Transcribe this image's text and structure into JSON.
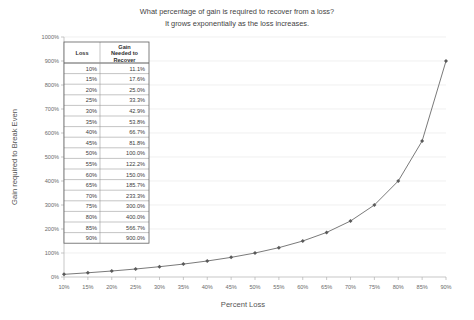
{
  "chart_data": {
    "type": "line",
    "title": "What percentage of gain is required to recover from a loss?",
    "subtitle": "It grows exponentially as the loss increases.",
    "xlabel": "Percent Loss",
    "ylabel": "Gain required to Break Even",
    "xlim": [
      10,
      90
    ],
    "ylim": [
      0,
      1000
    ],
    "grid": true,
    "legend": "none",
    "x_tick_labels": [
      "10%",
      "15%",
      "20%",
      "25%",
      "30%",
      "35%",
      "40%",
      "45%",
      "50%",
      "55%",
      "60%",
      "65%",
      "70%",
      "75%",
      "80%",
      "85%",
      "90%"
    ],
    "x_tick_values": [
      10,
      15,
      20,
      25,
      30,
      35,
      40,
      45,
      50,
      55,
      60,
      65,
      70,
      75,
      80,
      85,
      90
    ],
    "y_tick_labels": [
      "0%",
      "100%",
      "200%",
      "300%",
      "400%",
      "500%",
      "600%",
      "700%",
      "800%",
      "900%",
      "1000%"
    ],
    "y_tick_values": [
      0,
      100,
      200,
      300,
      400,
      500,
      600,
      700,
      800,
      900,
      1000
    ],
    "x": [
      10,
      15,
      20,
      25,
      30,
      35,
      40,
      45,
      50,
      55,
      60,
      65,
      70,
      75,
      80,
      85,
      90
    ],
    "values": [
      11.1,
      17.6,
      25.0,
      33.3,
      42.9,
      53.8,
      66.7,
      81.8,
      100.0,
      122.2,
      150.0,
      185.7,
      233.3,
      300.0,
      400.0,
      566.7,
      900.0
    ],
    "series": [
      {
        "name": "Gain Needed to Recover",
        "values": [
          11.1,
          17.6,
          25.0,
          33.3,
          42.9,
          53.8,
          66.7,
          81.8,
          100.0,
          122.2,
          150.0,
          185.7,
          233.3,
          300.0,
          400.0,
          566.7,
          900.0
        ]
      }
    ],
    "line_color": "#7a7a7a",
    "marker_color": "#5a5a5a"
  },
  "table": {
    "headers": [
      "Loss",
      "Gain Needed to Recover"
    ],
    "header_lines": [
      [
        "Loss"
      ],
      [
        "Gain",
        "Needed to",
        "Recover"
      ]
    ],
    "rows": [
      [
        "10%",
        "11.1%"
      ],
      [
        "15%",
        "17.6%"
      ],
      [
        "20%",
        "25.0%"
      ],
      [
        "25%",
        "33.3%"
      ],
      [
        "30%",
        "42.9%"
      ],
      [
        "35%",
        "53.8%"
      ],
      [
        "40%",
        "66.7%"
      ],
      [
        "45%",
        "81.8%"
      ],
      [
        "50%",
        "100.0%"
      ],
      [
        "55%",
        "122.2%"
      ],
      [
        "60%",
        "150.0%"
      ],
      [
        "65%",
        "185.7%"
      ],
      [
        "70%",
        "233.3%"
      ],
      [
        "75%",
        "300.0%"
      ],
      [
        "80%",
        "400.0%"
      ],
      [
        "85%",
        "566.7%"
      ],
      [
        "90%",
        "900.0%"
      ]
    ]
  }
}
